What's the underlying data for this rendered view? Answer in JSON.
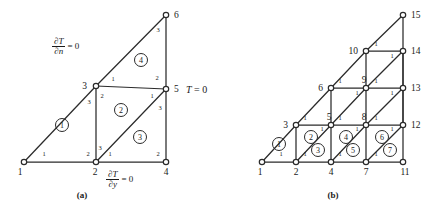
{
  "figure": {
    "panels": [
      {
        "id": "panel-a",
        "caption": "(a)",
        "origin": {
          "x": 24,
          "y": 162
        },
        "nodes": [
          {
            "id": 1,
            "label": "1",
            "x": 24,
            "y": 162,
            "label_dx": -4,
            "label_dy": 13,
            "anchor": "middle"
          },
          {
            "id": 2,
            "label": "2",
            "x": 96,
            "y": 162,
            "label_dx": -1,
            "label_dy": 13,
            "anchor": "middle"
          },
          {
            "id": 3,
            "label": "3",
            "x": 96,
            "y": 86,
            "label_dx": -9,
            "label_dy": 3,
            "anchor": "end"
          },
          {
            "id": 4,
            "label": "4",
            "x": 166,
            "y": 162,
            "label_dx": 0,
            "label_dy": 13,
            "anchor": "middle"
          },
          {
            "id": 5,
            "label": "5",
            "x": 166,
            "y": 89,
            "label_dx": 8,
            "label_dy": 3,
            "anchor": "start"
          },
          {
            "id": 6,
            "label": "6",
            "x": 166,
            "y": 15,
            "label_dx": 8,
            "label_dy": 3,
            "anchor": "start"
          }
        ],
        "edges": [
          {
            "from": 1,
            "to": 2
          },
          {
            "from": 2,
            "to": 4
          },
          {
            "from": 1,
            "to": 3
          },
          {
            "from": 3,
            "to": 6
          },
          {
            "from": 2,
            "to": 3
          },
          {
            "from": 3,
            "to": 5
          },
          {
            "from": 2,
            "to": 5
          },
          {
            "from": 4,
            "to": 5
          },
          {
            "from": 5,
            "to": 6
          }
        ],
        "elements": [
          {
            "id": 1,
            "label": "1",
            "cx": 62,
            "cy": 125
          },
          {
            "id": 2,
            "label": "2",
            "cx": 121,
            "cy": 110
          },
          {
            "id": 3,
            "label": "3",
            "cx": 140,
            "cy": 137
          },
          {
            "id": 4,
            "label": "4",
            "cx": 141,
            "cy": 60
          }
        ],
        "local_numbers": [
          {
            "text": "1",
            "x": 44,
            "y": 156
          },
          {
            "text": "2",
            "x": 88,
            "y": 156
          },
          {
            "text": "3",
            "x": 89,
            "y": 104
          },
          {
            "text": "2",
            "x": 102,
            "y": 98
          },
          {
            "text": "1",
            "x": 113,
            "y": 81
          },
          {
            "text": "3",
            "x": 100,
            "y": 150
          },
          {
            "text": "1",
            "x": 110,
            "y": 156
          },
          {
            "text": "2",
            "x": 158,
            "y": 156
          },
          {
            "text": "1",
            "x": 152,
            "y": 98
          },
          {
            "text": "3",
            "x": 160,
            "y": 110
          },
          {
            "text": "2",
            "x": 157,
            "y": 80
          },
          {
            "text": "3",
            "x": 158,
            "y": 32
          }
        ],
        "boundary_conditions": [
          {
            "id": "bc-dt-dn",
            "kind": "fraction",
            "numerator": "∂T",
            "denominator": "∂n",
            "tail": "= 0",
            "x": 52,
            "y": 37
          },
          {
            "id": "bc-dt-dy",
            "kind": "fraction",
            "numerator": "∂T",
            "denominator": "∂y",
            "tail": "= 0",
            "x": 106,
            "y": 170
          },
          {
            "id": "bc-t-zero",
            "kind": "plain",
            "text": "T = 0",
            "x": 186,
            "y": 84
          }
        ],
        "caption_pos": {
          "x": 82,
          "y": 198
        }
      },
      {
        "id": "panel-b",
        "caption": "(b)",
        "nodes": [
          {
            "id": 1,
            "label": "1",
            "x": 262,
            "y": 162,
            "label_dx": -2,
            "label_dy": 13,
            "anchor": "middle"
          },
          {
            "id": 2,
            "label": "2",
            "x": 296,
            "y": 162,
            "label_dx": 0,
            "label_dy": 13,
            "anchor": "middle"
          },
          {
            "id": 3,
            "label": "3",
            "x": 296,
            "y": 125,
            "label_dx": -8,
            "label_dy": 3,
            "anchor": "end"
          },
          {
            "id": 4,
            "label": "4",
            "x": 331,
            "y": 162,
            "label_dx": 0,
            "label_dy": 13,
            "anchor": "middle"
          },
          {
            "id": 5,
            "label": "5",
            "x": 331,
            "y": 125,
            "label_dx": -2,
            "label_dy": -5,
            "anchor": "middle"
          },
          {
            "id": 6,
            "label": "6",
            "x": 331,
            "y": 88,
            "label_dx": -8,
            "label_dy": 3,
            "anchor": "end"
          },
          {
            "id": 7,
            "label": "7",
            "x": 366,
            "y": 162,
            "label_dx": 0,
            "label_dy": 13,
            "anchor": "middle"
          },
          {
            "id": 8,
            "label": "8",
            "x": 366,
            "y": 125,
            "label_dx": -2,
            "label_dy": -5,
            "anchor": "middle"
          },
          {
            "id": 9,
            "label": "9",
            "x": 366,
            "y": 88,
            "label_dx": -2,
            "label_dy": -5,
            "anchor": "middle"
          },
          {
            "id": 10,
            "label": "10",
            "x": 366,
            "y": 51,
            "label_dx": -8,
            "label_dy": 3,
            "anchor": "end"
          },
          {
            "id": 11,
            "label": "11",
            "x": 403,
            "y": 162,
            "label_dx": 2,
            "label_dy": 13,
            "anchor": "middle"
          },
          {
            "id": 12,
            "label": "12",
            "x": 403,
            "y": 125,
            "label_dx": 8,
            "label_dy": 3,
            "anchor": "start"
          },
          {
            "id": 13,
            "label": "13",
            "x": 403,
            "y": 88,
            "label_dx": 8,
            "label_dy": 3,
            "anchor": "start"
          },
          {
            "id": 14,
            "label": "14",
            "x": 403,
            "y": 51,
            "label_dx": 8,
            "label_dy": 3,
            "anchor": "start"
          },
          {
            "id": 15,
            "label": "15",
            "x": 403,
            "y": 15,
            "label_dx": 8,
            "label_dy": 3,
            "anchor": "start"
          }
        ],
        "edges": [
          {
            "from": 1,
            "to": 2
          },
          {
            "from": 2,
            "to": 4
          },
          {
            "from": 4,
            "to": 7
          },
          {
            "from": 7,
            "to": 11
          },
          {
            "from": 1,
            "to": 3
          },
          {
            "from": 3,
            "to": 6
          },
          {
            "from": 6,
            "to": 10
          },
          {
            "from": 10,
            "to": 15
          },
          {
            "from": 2,
            "to": 3
          },
          {
            "from": 4,
            "to": 5
          },
          {
            "from": 5,
            "to": 6
          },
          {
            "from": 7,
            "to": 8
          },
          {
            "from": 8,
            "to": 9
          },
          {
            "from": 9,
            "to": 10
          },
          {
            "from": 11,
            "to": 12
          },
          {
            "from": 12,
            "to": 13
          },
          {
            "from": 13,
            "to": 14
          },
          {
            "from": 14,
            "to": 15
          },
          {
            "from": 3,
            "to": 5
          },
          {
            "from": 5,
            "to": 8
          },
          {
            "from": 8,
            "to": 12
          },
          {
            "from": 6,
            "to": 9
          },
          {
            "from": 9,
            "to": 13
          },
          {
            "from": 10,
            "to": 14
          },
          {
            "from": 2,
            "to": 5
          },
          {
            "from": 4,
            "to": 8
          },
          {
            "from": 7,
            "to": 12
          },
          {
            "from": 5,
            "to": 9
          },
          {
            "from": 8,
            "to": 13
          },
          {
            "from": 9,
            "to": 14
          },
          {
            "from": 12,
            "to": 14
          }
        ],
        "elements": [
          {
            "id": 1,
            "label": "1",
            "cx": 279,
            "cy": 144
          },
          {
            "id": 2,
            "label": "2",
            "cx": 311,
            "cy": 137
          },
          {
            "id": 3,
            "label": "3",
            "cx": 318,
            "cy": 150
          },
          {
            "id": 4,
            "label": "4",
            "cx": 346,
            "cy": 137
          },
          {
            "id": 5,
            "label": "5",
            "cx": 353,
            "cy": 150
          },
          {
            "id": 6,
            "label": "6",
            "cx": 382,
            "cy": 137
          },
          {
            "id": 7,
            "label": "7",
            "cx": 390,
            "cy": 150
          }
        ],
        "local_numbers": [
          {
            "text": "1",
            "x": 281,
            "y": 156
          },
          {
            "text": "1",
            "x": 305,
            "y": 120
          },
          {
            "text": "1",
            "x": 322,
            "y": 131
          },
          {
            "text": "1",
            "x": 305,
            "y": 156
          },
          {
            "text": "1",
            "x": 340,
            "y": 120
          },
          {
            "text": "1",
            "x": 357,
            "y": 131
          },
          {
            "text": "1",
            "x": 340,
            "y": 156
          },
          {
            "text": "1",
            "x": 376,
            "y": 120
          },
          {
            "text": "1",
            "x": 392,
            "y": 131
          },
          {
            "text": "1",
            "x": 376,
            "y": 156
          },
          {
            "text": "1",
            "x": 340,
            "y": 83
          },
          {
            "text": "1",
            "x": 357,
            "y": 95
          },
          {
            "text": "1",
            "x": 376,
            "y": 83
          },
          {
            "text": "1",
            "x": 392,
            "y": 95
          },
          {
            "text": "1",
            "x": 376,
            "y": 46
          },
          {
            "text": "1",
            "x": 392,
            "y": 58
          }
        ],
        "caption_pos": {
          "x": 333,
          "y": 198
        }
      }
    ]
  }
}
